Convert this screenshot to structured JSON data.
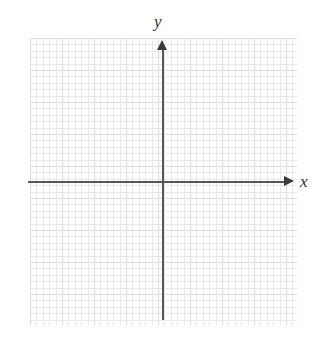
{
  "figure": {
    "kind": "cartesian-coordinate-plane",
    "title": "",
    "background_color": "#ffffff",
    "width": 336,
    "height": 342
  },
  "axes": {
    "x": {
      "label": "x",
      "label_style": "italic-serif",
      "color": "#565659",
      "arrow": "right",
      "arrow_color": "#3b3b3e",
      "start_px": 28,
      "end_px": 294,
      "position_y_px": 182,
      "tick_labels": [],
      "tick_values": []
    },
    "y": {
      "label": "y",
      "label_style": "italic-serif",
      "color": "#565659",
      "arrow": "up",
      "arrow_color": "#3b3b3e",
      "start_px": 40,
      "end_px": 320,
      "position_x_px": 163,
      "tick_labels": [],
      "tick_values": []
    }
  },
  "grid": {
    "visible": true,
    "major_spacing_px": 32,
    "minor_spacing_px": 6.4,
    "minor_per_major": 5,
    "major_color": "#dcdce2",
    "minor_color": "#e9e9ec",
    "left_px": 30,
    "top_px": 38,
    "width_px": 267,
    "height_px": 287
  },
  "chart_data": {
    "type": "scatter",
    "title": "",
    "xlabel": "x",
    "ylabel": "y",
    "series": [],
    "x": [],
    "values": [],
    "annotations": [],
    "legend": [],
    "legend_position": "none",
    "grid": true,
    "xlim": [
      -4.2,
      4.1
    ],
    "ylim": [
      -4.3,
      4.5
    ],
    "note": "Empty coordinate plane: graph paper grid with labeled x and y axes, no plotted data."
  }
}
